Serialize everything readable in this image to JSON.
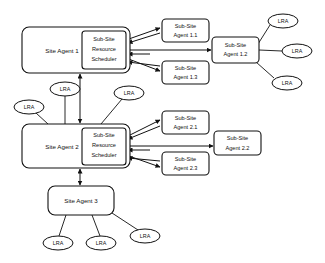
{
  "diagram": {
    "type": "node-link-diagram",
    "colors": {
      "background": "#ffffff",
      "stroke": "#111111",
      "fill": "#ffffff"
    },
    "site_agents": [
      {
        "id": "site-agent-1",
        "label": "Site Agent 1",
        "x": 22,
        "y": 27,
        "w": 108,
        "h": 46,
        "scheduler": {
          "id": "scheduler-1",
          "line1": "Sub-Site",
          "line2": "Resource",
          "line3": "Scheduler",
          "x": 82,
          "y": 31,
          "w": 44,
          "h": 38
        }
      },
      {
        "id": "site-agent-2",
        "label": "Site Agent 2",
        "x": 22,
        "y": 124,
        "w": 108,
        "h": 44,
        "scheduler": {
          "id": "scheduler-2",
          "line1": "Sub-Site",
          "line2": "Resource",
          "line3": "Scheduler",
          "x": 82,
          "y": 128,
          "w": 44,
          "h": 37
        }
      },
      {
        "id": "site-agent-3",
        "label": "Site Agent 3",
        "x": 48,
        "y": 186,
        "w": 66,
        "h": 29,
        "scheduler": null
      }
    ],
    "sub_site_agents": [
      {
        "id": "sub-site-agent-1-1",
        "line1": "Sub-Site",
        "line2": "Agent 1.1",
        "x": 162,
        "y": 19,
        "w": 47,
        "h": 23
      },
      {
        "id": "sub-site-agent-1-3",
        "line1": "Sub-Site",
        "line2": "Agent 1.3",
        "x": 162,
        "y": 61,
        "w": 47,
        "h": 23
      },
      {
        "id": "sub-site-agent-1-2",
        "line1": "Sub-Site",
        "line2": "Agent 1.2",
        "x": 212,
        "y": 37,
        "w": 47,
        "h": 26
      },
      {
        "id": "sub-site-agent-2-1",
        "line1": "Sub-Site",
        "line2": "Agent 2.1",
        "x": 162,
        "y": 111,
        "w": 47,
        "h": 23
      },
      {
        "id": "sub-site-agent-2-3",
        "line1": "Sub-Site",
        "line2": "Agent 2.3",
        "x": 162,
        "y": 152,
        "w": 47,
        "h": 23
      },
      {
        "id": "sub-site-agent-2-2",
        "line1": "Sub-Site",
        "line2": "Agent 2.2",
        "x": 214,
        "y": 131,
        "w": 47,
        "h": 24
      }
    ],
    "lra_nodes": [
      {
        "id": "lra-r1",
        "label": "LRA",
        "cx": 283,
        "cy": 21,
        "rx": 15,
        "ry": 7,
        "attached_to": "sub-site-agent-1-2"
      },
      {
        "id": "lra-r2",
        "label": "LRA",
        "cx": 297,
        "cy": 51,
        "rx": 15,
        "ry": 7,
        "attached_to": "sub-site-agent-1-2"
      },
      {
        "id": "lra-r3",
        "label": "LRA",
        "cx": 287,
        "cy": 83,
        "rx": 15,
        "ry": 7,
        "attached_to": "sub-site-agent-1-2"
      },
      {
        "id": "lra-m1",
        "label": "LRA",
        "cx": 65,
        "cy": 89,
        "rx": 15,
        "ry": 7,
        "attached_to": "site-agent-2"
      },
      {
        "id": "lra-m2",
        "label": "LRA",
        "cx": 29,
        "cy": 107,
        "rx": 15,
        "ry": 7,
        "attached_to": "site-agent-2"
      },
      {
        "id": "lra-m3",
        "label": "LRA",
        "cx": 129,
        "cy": 93,
        "rx": 15,
        "ry": 7,
        "attached_to": "site-agent-2"
      },
      {
        "id": "lra-b1",
        "label": "LRA",
        "cx": 58,
        "cy": 243,
        "rx": 15,
        "ry": 7,
        "attached_to": "site-agent-3"
      },
      {
        "id": "lra-b2",
        "label": "LRA",
        "cx": 101,
        "cy": 243,
        "rx": 15,
        "ry": 7,
        "attached_to": "site-agent-3"
      },
      {
        "id": "lra-b3",
        "label": "LRA",
        "cx": 145,
        "cy": 236,
        "rx": 15,
        "ry": 7,
        "attached_to": "site-agent-3"
      }
    ],
    "connections": [
      {
        "from": "scheduler-1",
        "to": "sub-site-agent-1-1",
        "style": "bidirectional"
      },
      {
        "from": "scheduler-1",
        "to": "sub-site-agent-1-2",
        "style": "bidirectional"
      },
      {
        "from": "scheduler-1",
        "to": "sub-site-agent-1-3",
        "style": "bidirectional"
      },
      {
        "from": "scheduler-2",
        "to": "sub-site-agent-2-1",
        "style": "bidirectional"
      },
      {
        "from": "scheduler-2",
        "to": "sub-site-agent-2-2",
        "style": "bidirectional"
      },
      {
        "from": "scheduler-2",
        "to": "sub-site-agent-2-3",
        "style": "bidirectional"
      },
      {
        "from": "site-agent-1",
        "to": "site-agent-2",
        "style": "bidirectional-vertical"
      },
      {
        "from": "site-agent-2",
        "to": "site-agent-3",
        "style": "bidirectional-vertical"
      }
    ]
  }
}
